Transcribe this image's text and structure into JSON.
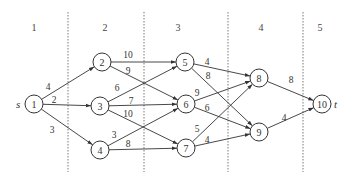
{
  "stages": [
    {
      "label": "1",
      "x": 34
    },
    {
      "label": "2",
      "x": 105
    },
    {
      "label": "3",
      "x": 178
    },
    {
      "label": "4",
      "x": 261
    },
    {
      "label": "5",
      "x": 320
    }
  ],
  "dividers": [
    68,
    144,
    228,
    303
  ],
  "nodes": [
    {
      "id": "1",
      "x": 34,
      "y": 104
    },
    {
      "id": "2",
      "x": 102,
      "y": 62
    },
    {
      "id": "3",
      "x": 100,
      "y": 106
    },
    {
      "id": "4",
      "x": 100,
      "y": 150
    },
    {
      "id": "5",
      "x": 185,
      "y": 62
    },
    {
      "id": "6",
      "x": 186,
      "y": 104
    },
    {
      "id": "7",
      "x": 186,
      "y": 148
    },
    {
      "id": "8",
      "x": 259,
      "y": 78
    },
    {
      "id": "9",
      "x": 259,
      "y": 132
    },
    {
      "id": "10",
      "x": 322,
      "y": 104
    }
  ],
  "terminals": {
    "source": "s",
    "sink": "t"
  },
  "edges": [
    {
      "from": "1",
      "to": "2",
      "weight": "4",
      "lx": 48,
      "ly": 90
    },
    {
      "from": "1",
      "to": "3",
      "weight": "2",
      "lx": 54,
      "ly": 103
    },
    {
      "from": "1",
      "to": "4",
      "weight": "3",
      "lx": 52,
      "ly": 133
    },
    {
      "from": "2",
      "to": "5",
      "weight": "10",
      "lx": 128,
      "ly": 58
    },
    {
      "from": "2",
      "to": "6",
      "weight": "9",
      "lx": 128,
      "ly": 74
    },
    {
      "from": "3",
      "to": "5",
      "weight": "6",
      "lx": 117,
      "ly": 91
    },
    {
      "from": "3",
      "to": "6",
      "weight": "7",
      "lx": 131,
      "ly": 104
    },
    {
      "from": "3",
      "to": "7",
      "weight": "10",
      "lx": 128,
      "ly": 117
    },
    {
      "from": "4",
      "to": "6",
      "weight": "3",
      "lx": 114,
      "ly": 138
    },
    {
      "from": "4",
      "to": "7",
      "weight": "8",
      "lx": 128,
      "ly": 147
    },
    {
      "from": "5",
      "to": "8",
      "weight": "4",
      "lx": 207,
      "ly": 65
    },
    {
      "from": "5",
      "to": "9",
      "weight": "8",
      "lx": 208,
      "ly": 79
    },
    {
      "from": "6",
      "to": "8",
      "weight": "9",
      "lx": 197,
      "ly": 96
    },
    {
      "from": "6",
      "to": "9",
      "weight": "6",
      "lx": 207,
      "ly": 111
    },
    {
      "from": "7",
      "to": "8",
      "weight": "5",
      "lx": 197,
      "ly": 132
    },
    {
      "from": "7",
      "to": "9",
      "weight": "4",
      "lx": 207,
      "ly": 143
    },
    {
      "from": "8",
      "to": "10",
      "weight": "8",
      "lx": 291,
      "ly": 83
    },
    {
      "from": "9",
      "to": "10",
      "weight": "4",
      "lx": 284,
      "ly": 121
    }
  ]
}
